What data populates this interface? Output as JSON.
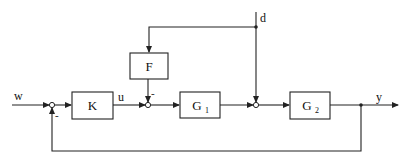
{
  "diagram": {
    "type": "control-block-diagram",
    "blocks": [
      {
        "id": "K",
        "label": "K"
      },
      {
        "id": "F",
        "label": "F"
      },
      {
        "id": "G1",
        "label": "G",
        "subscript": "1"
      },
      {
        "id": "G2",
        "label": "G",
        "subscript": "2"
      }
    ],
    "signals": {
      "reference": "w",
      "control": "u",
      "disturbance": "d",
      "output": "y"
    },
    "signs": {
      "feedback_sign": "-",
      "feedforward_sign": "-"
    },
    "colors": {
      "line": "#222222",
      "background": "#ffffff"
    }
  }
}
